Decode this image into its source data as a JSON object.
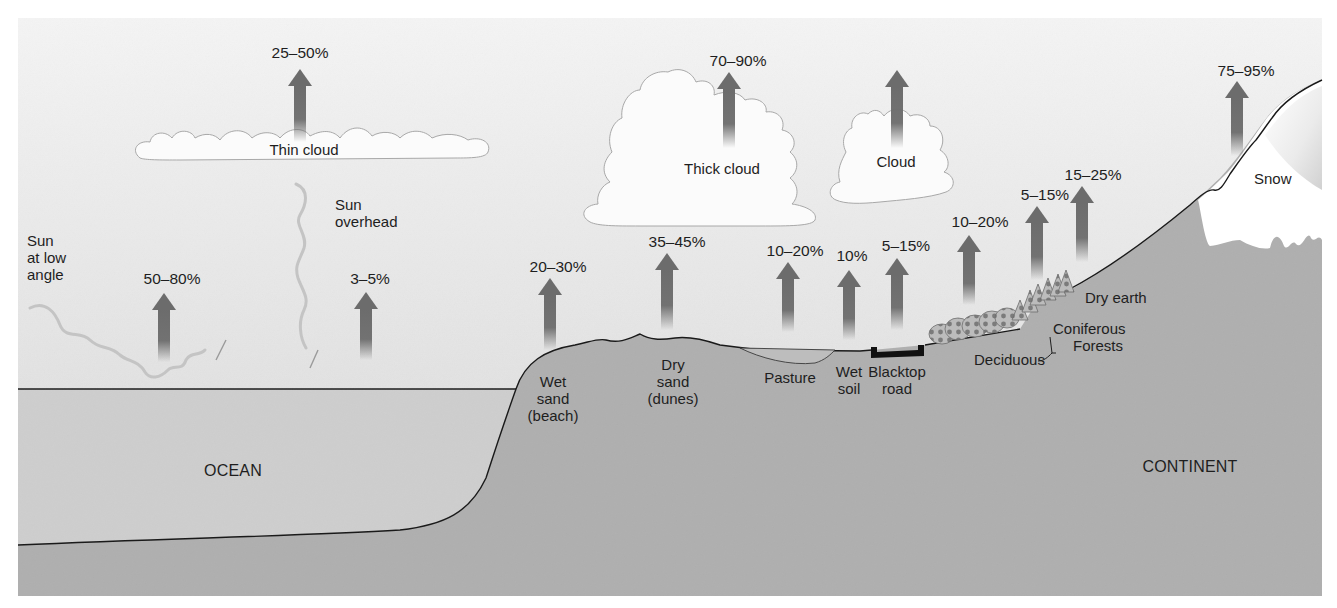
{
  "colors": {
    "sky_top": "#f3f3f3",
    "sky_bottom": "#d9d9d9",
    "ocean": "#cecece",
    "land": "#afafaf",
    "arrow": "#6c6c6c",
    "cloud": "#fbfbfb",
    "cloud_edge": "#a8a8a8",
    "outline": "#1a1a1a",
    "road": "#111111",
    "forest": "#8a8a8a",
    "snow": "#ffffff"
  },
  "regions": {
    "ocean": "OCEAN",
    "continent": "CONTINENT"
  },
  "sun": {
    "low_angle": [
      "Sun",
      "at low",
      "angle"
    ],
    "overhead": [
      "Sun",
      "overhead"
    ]
  },
  "clouds": {
    "thin": "Thin cloud",
    "thick": "Thick cloud",
    "cloud": "Cloud"
  },
  "albedo": [
    {
      "id": "thin-cloud",
      "value": "25–50%",
      "x": 300,
      "label_y": 44,
      "head_y": 69,
      "tail_y": 142
    },
    {
      "id": "sun-low-angle",
      "value": "50–80%",
      "x": 164,
      "label_y": 270,
      "head_y": 293,
      "tail_y": 362
    },
    {
      "id": "sun-overhead",
      "value": "3–5%",
      "x": 366,
      "label_y": 270,
      "head_y": 292,
      "tail_y": 360
    },
    {
      "id": "thick-cloud",
      "value": "70–90%",
      "x": 729,
      "label_y": 52,
      "head_y": 72,
      "tail_y": 148
    },
    {
      "id": "cloud",
      "value": "",
      "x": 897,
      "label_y": 0,
      "head_y": 70,
      "tail_y": 148
    },
    {
      "id": "wet-sand",
      "value": "20–30%",
      "x": 550,
      "label_y": 258,
      "head_y": 278,
      "tail_y": 350
    },
    {
      "id": "dry-sand",
      "value": "35–45%",
      "x": 667,
      "label_y": 233,
      "head_y": 253,
      "tail_y": 330
    },
    {
      "id": "pasture",
      "value": "10–20%",
      "x": 788,
      "label_y": 242,
      "head_y": 262,
      "tail_y": 332
    },
    {
      "id": "wet-soil",
      "value": "10%",
      "x": 849,
      "label_y": 247,
      "head_y": 270,
      "tail_y": 340
    },
    {
      "id": "blacktop-road",
      "value": "5–15%",
      "x": 897,
      "label_y": 237,
      "head_y": 258,
      "tail_y": 330
    },
    {
      "id": "deciduous",
      "value": "10–20%",
      "x": 969,
      "label_y": 213,
      "head_y": 235,
      "tail_y": 305
    },
    {
      "id": "coniferous",
      "value": "5–15%",
      "x": 1037,
      "label_y": 186,
      "head_y": 206,
      "tail_y": 280
    },
    {
      "id": "dry-earth",
      "value": "15–25%",
      "x": 1082,
      "label_y": 166,
      "head_y": 186,
      "tail_y": 262
    },
    {
      "id": "snow",
      "value": "75–95%",
      "x": 1237,
      "label_y": 62,
      "head_y": 81,
      "tail_y": 156
    }
  ],
  "surfaces": {
    "wet_sand": [
      "Wet",
      "sand",
      "(beach)"
    ],
    "dry_sand": [
      "Dry",
      "sand",
      "(dunes)"
    ],
    "pasture": "Pasture",
    "wet_soil": [
      "Wet",
      "soil"
    ],
    "blacktop_road": [
      "Blacktop",
      "road"
    ],
    "deciduous": "Deciduous",
    "forests": [
      "Coniferous",
      "Forests"
    ],
    "dry_earth": "Dry earth",
    "snow": "Snow"
  }
}
